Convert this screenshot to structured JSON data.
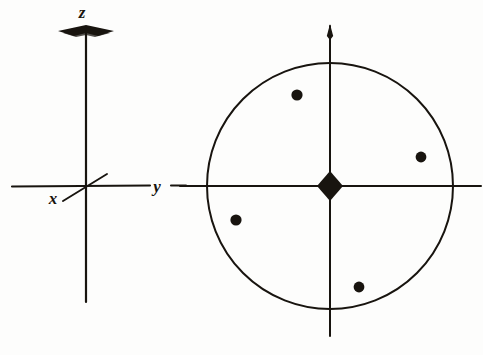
{
  "figure": {
    "kind": "scanned-line-drawing",
    "background_color": "#fdfdfc",
    "ink_color": "#18140f",
    "width": 483,
    "height": 355
  },
  "left_panel": {
    "name": "coordinate-axes",
    "description": "Three orthogonal crystallographic axes drawn in projection",
    "origin": {
      "x": 86,
      "y": 186
    },
    "axes": [
      {
        "id": "z",
        "label": "z",
        "label_x": 82,
        "label_y": 14,
        "direction": "vertical-up",
        "line": {
          "x1": 86,
          "y1": 30,
          "x2": 86,
          "y2": 302
        },
        "arrowhead": "flat-dart",
        "arrow_x": 86,
        "arrow_y": 31,
        "arrow_half_width": 28,
        "arrow_half_height": 5
      },
      {
        "id": "y",
        "label": "y",
        "label_x": 157,
        "label_y": 192,
        "direction": "horizontal-right",
        "line": {
          "x1": 12,
          "y1": 186,
          "x2": 150,
          "y2": 186
        },
        "line_tail": {
          "x1": 171,
          "y1": 186,
          "x2": 186,
          "y2": 186
        },
        "arrowhead": "none"
      },
      {
        "id": "x",
        "label": "x",
        "label_x": 53,
        "label_y": 203,
        "direction": "diagonal-toward-viewer",
        "line": {
          "x1": 63,
          "y1": 200,
          "x2": 107,
          "y2": 175
        },
        "arrowhead": "none"
      }
    ]
  },
  "right_panel": {
    "name": "stereographic-projection",
    "description": "Great circle with crossed reference axes, a solid diamond marker at the centre and four solid circular poles",
    "center": {
      "x": 330,
      "y": 186
    },
    "circle": {
      "cx": 330,
      "cy": 186,
      "r": 123
    },
    "vertical_axis": {
      "x1": 330,
      "y1": 24,
      "x2": 330,
      "y2": 336
    },
    "vertical_axis_arrowhead": {
      "x": 330,
      "y": 25,
      "half_width": 3,
      "height": 13
    },
    "horizontal_axis": {
      "x1": 180,
      "y1": 186,
      "x2": 481,
      "y2": 186
    },
    "center_marker": {
      "shape": "diamond",
      "cx": 330,
      "cy": 186,
      "half_width": 13,
      "half_height": 15,
      "filled": true
    },
    "poles": [
      {
        "id": "pole-upper-left",
        "cx": 297,
        "cy": 95,
        "r": 5.6
      },
      {
        "id": "pole-right",
        "cx": 421,
        "cy": 157,
        "r": 5.4
      },
      {
        "id": "pole-lower-left",
        "cx": 236,
        "cy": 220,
        "r": 5.6
      },
      {
        "id": "pole-bottom",
        "cx": 359,
        "cy": 287,
        "r": 5.4
      }
    ]
  }
}
